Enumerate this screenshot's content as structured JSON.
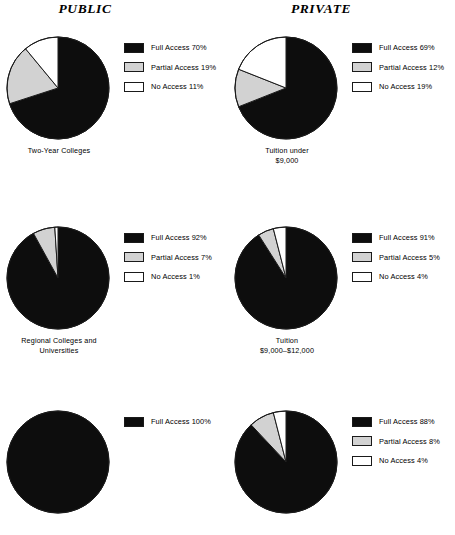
{
  "columns": [
    {
      "title": "PUBLIC"
    },
    {
      "title": "PRIVATE"
    }
  ],
  "colors": {
    "full_access": "#0d0d0d",
    "partial_access": "#d2d2d2",
    "no_access": "#ffffff",
    "outline": "#1a1a1a",
    "background": "#ffffff"
  },
  "legend_series": [
    "Full Access",
    "Partial Access",
    "No Access"
  ],
  "chart_data": [
    {
      "type": "pie",
      "id": "public-two-year-colleges",
      "column": "PUBLIC",
      "row": 1,
      "title": "Two-Year Colleges",
      "caption": "Two-Year Colleges",
      "labels": [
        "Full Access",
        "Partial Access",
        "No Access"
      ],
      "values": [
        70,
        19,
        11
      ],
      "unit": "%",
      "legend": [
        {
          "label": "Full Access 70%",
          "value": 70,
          "color": "#0d0d0d"
        },
        {
          "label": "Partial Access 19%",
          "value": 19,
          "color": "#d2d2d2"
        },
        {
          "label": "No Access 11%",
          "value": 11,
          "color": "#ffffff"
        }
      ],
      "legend_position": "right",
      "start_angle_deg": 0,
      "direction": "clockwise"
    },
    {
      "type": "pie",
      "id": "private-tuition-under-9000",
      "column": "PRIVATE",
      "row": 1,
      "title": "Tuition under $9,000",
      "caption": "Tuition under\n$9,000",
      "labels": [
        "Full Access",
        "Partial Access",
        "No Access"
      ],
      "values": [
        69,
        12,
        19
      ],
      "unit": "%",
      "legend": [
        {
          "label": "Full Access 69%",
          "value": 69,
          "color": "#0d0d0d"
        },
        {
          "label": "Partial Access 12%",
          "value": 12,
          "color": "#d2d2d2"
        },
        {
          "label": "No Access 19%",
          "value": 19,
          "color": "#ffffff"
        }
      ],
      "legend_position": "right",
      "start_angle_deg": 0,
      "direction": "clockwise"
    },
    {
      "type": "pie",
      "id": "public-regional-colleges-universities",
      "column": "PUBLIC",
      "row": 2,
      "title": "Regional Colleges and Universities",
      "caption": "Regional Colleges and\nUniversities",
      "labels": [
        "Full Access",
        "Partial Access",
        "No Access"
      ],
      "values": [
        92,
        7,
        1
      ],
      "unit": "%",
      "legend": [
        {
          "label": "Full Access 92%",
          "value": 92,
          "color": "#0d0d0d"
        },
        {
          "label": "Partial Access 7%",
          "value": 7,
          "color": "#d2d2d2"
        },
        {
          "label": "No Access 1%",
          "value": 1,
          "color": "#ffffff"
        }
      ],
      "legend_position": "right",
      "start_angle_deg": 0,
      "direction": "clockwise"
    },
    {
      "type": "pie",
      "id": "private-tuition-9000-12000",
      "column": "PRIVATE",
      "row": 2,
      "title": "Tuition $9,000–$12,000",
      "caption": "Tuition\n$9,000–$12,000",
      "labels": [
        "Full Access",
        "Partial Access",
        "No Access"
      ],
      "values": [
        91,
        5,
        4
      ],
      "unit": "%",
      "legend": [
        {
          "label": "Full Access 91%",
          "value": 91,
          "color": "#0d0d0d"
        },
        {
          "label": "Partial Access 5%",
          "value": 5,
          "color": "#d2d2d2"
        },
        {
          "label": "No Access 4%",
          "value": 4,
          "color": "#ffffff"
        }
      ],
      "legend_position": "right",
      "start_angle_deg": 0,
      "direction": "clockwise"
    },
    {
      "type": "pie",
      "id": "public-row3",
      "column": "PUBLIC",
      "row": 3,
      "title": "",
      "caption": "",
      "labels": [
        "Full Access"
      ],
      "values": [
        100
      ],
      "unit": "%",
      "legend": [
        {
          "label": "Full Access 100%",
          "value": 100,
          "color": "#0d0d0d"
        }
      ],
      "legend_position": "right",
      "start_angle_deg": 0,
      "direction": "clockwise"
    },
    {
      "type": "pie",
      "id": "private-row3",
      "column": "PRIVATE",
      "row": 3,
      "title": "",
      "caption": "",
      "labels": [
        "Full Access",
        "Partial Access",
        "No Access"
      ],
      "values": [
        88,
        8,
        4
      ],
      "unit": "%",
      "legend": [
        {
          "label": "Full Access 88%",
          "value": 88,
          "color": "#0d0d0d"
        },
        {
          "label": "Partial Access 8%",
          "value": 8,
          "color": "#d2d2d2"
        },
        {
          "label": "No Access 4%",
          "value": 4,
          "color": "#ffffff"
        }
      ],
      "legend_position": "right",
      "start_angle_deg": 0,
      "direction": "clockwise"
    }
  ]
}
